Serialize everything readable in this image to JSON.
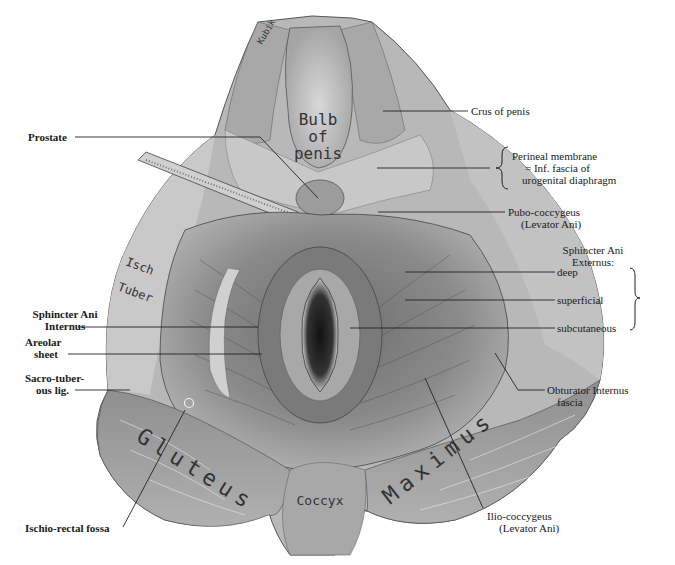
{
  "figure": {
    "type": "anatomical-illustration",
    "colors": {
      "background": "#ffffff",
      "ink": "#1a1a1a",
      "tissue_light": "#d8d8d8",
      "tissue_mid": "#9a9a9a",
      "tissue_dark": "#4a4a4a"
    }
  },
  "in_figure_labels": {
    "bulb": [
      "Bulb",
      "of",
      "penis"
    ],
    "ischial": [
      "Isch",
      "Tuber"
    ],
    "gluteus": "Gluteus",
    "maximus": "Maximus",
    "coccyx": "Coccyx",
    "signature": "Kubik"
  },
  "labels": {
    "left": {
      "prostate": "Prostate",
      "sphincter_internus": [
        "Sphincter Ani",
        "Internus"
      ],
      "areolar_sheet": [
        "Areolar",
        "sheet"
      ],
      "sacrotuberous": [
        "Sacro-tuber-",
        "ous lig."
      ],
      "ischiorectal": "Ischio-rectal fossa"
    },
    "right": {
      "crus": "Crus of penis",
      "perineal_membrane": [
        "Perineal membrane",
        "= Inf. fascia of",
        "urogenital diaphragm"
      ],
      "pubococcygeus": [
        "Pubo-coccygeus",
        "(Levator Ani)"
      ],
      "sphincter_externus": [
        "Sphincter Ani",
        "Externus:"
      ],
      "deep": "deep",
      "superficial": "superficial",
      "subcutaneous": "subcutaneous",
      "obturator": [
        "Obturator Internus",
        "fascia"
      ],
      "iliococcygeus": [
        "Ilio-coccygeus",
        "(Levator Ani)"
      ]
    }
  }
}
